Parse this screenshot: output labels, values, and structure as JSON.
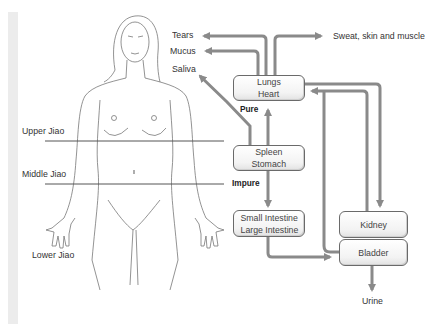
{
  "body_labels": {
    "upper_jiao": "Upper Jiao",
    "middle_jiao": "Middle Jiao",
    "lower_jiao": "Lower Jiao"
  },
  "outputs": {
    "tears": "Tears",
    "mucus": "Mucus",
    "saliva": "Saliva",
    "sweat": "Sweat, skin and muscle",
    "urine": "Urine"
  },
  "flow_labels": {
    "pure": "Pure",
    "impure": "Impure"
  },
  "organs": {
    "lungs_heart": [
      "Lungs",
      "Heart"
    ],
    "spleen_stomach": [
      "Spleen",
      "Stomach"
    ],
    "intestines": [
      "Small Intestine",
      "Large Intestine"
    ],
    "kidney": "Kidney",
    "bladder": "Bladder"
  },
  "colors": {
    "arrow": "#8a8a8a",
    "box_border": "#6a6a6a",
    "line": "#555555"
  }
}
